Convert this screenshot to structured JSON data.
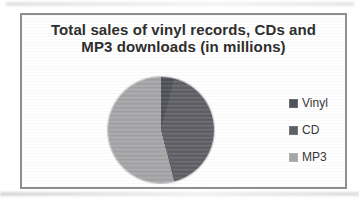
{
  "chart": {
    "title_line1": "Total sales of vinyl records, CDs and",
    "title_line2": "MP3 downloads (in millions)",
    "title_color": "#2d2d2d",
    "frame_border_color": "#8e8e8e",
    "background": "#ffffff"
  },
  "legend": {
    "position": "right",
    "items": [
      {
        "label": "Vinyl",
        "color": "#50505a"
      },
      {
        "label": "CD",
        "color": "#5f5f66"
      },
      {
        "label": "MP3",
        "color": "#a6a6a8"
      }
    ]
  },
  "chart_data": {
    "type": "pie",
    "title": "Total sales of vinyl records, CDs and MP3 downloads (in millions)",
    "unit": "millions",
    "labels": [
      "Vinyl",
      "CD",
      "MP3"
    ],
    "values_percent_estimated": [
      4,
      42,
      54
    ],
    "colors": [
      "#50505a",
      "#5f5f66",
      "#a6a6a8"
    ],
    "start_angle_deg": 0,
    "direction": "clockwise",
    "data_labels": false,
    "grid": false,
    "legend_position": "right"
  }
}
